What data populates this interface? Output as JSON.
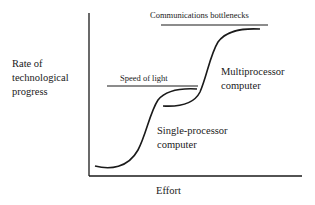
{
  "diagram": {
    "y_axis_label": "Rate of technological progress",
    "y_axis_label_lines": [
      "Rate of",
      "technological",
      "progress"
    ],
    "x_axis_label": "Effort",
    "limits": [
      {
        "label": "Communications bottlenecks"
      },
      {
        "label": "Speed of light"
      }
    ],
    "curves": [
      {
        "label_lines": [
          "Single-processor",
          "computer"
        ]
      },
      {
        "label_lines": [
          "Multiprocessor",
          "computer"
        ]
      }
    ],
    "colors": {
      "ink": "#1a1a1a",
      "background": "#ffffff"
    }
  }
}
